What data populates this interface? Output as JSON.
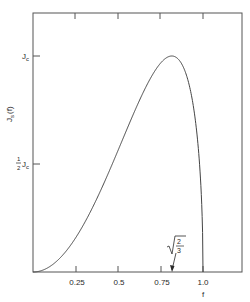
{
  "chart_data": {
    "type": "line",
    "title": "",
    "xlabel": "f",
    "ylabel": "J_s(f)",
    "xlim": [
      0,
      1.2
    ],
    "ylim": [
      0,
      1.05
    ],
    "grid": false,
    "x_ticks": [
      0.25,
      0.5,
      0.75,
      1.0
    ],
    "x_tick_labels": [
      "0.25",
      "0.5",
      "0.75",
      "1.0"
    ],
    "y_ticks": [
      0.5,
      1.0
    ],
    "y_tick_labels": [
      "½ J_c",
      "J_c"
    ],
    "series": [
      {
        "name": "J_s(f)",
        "formula": "J_c * f^2 * sqrt(1 - f^2) / ((2/3) * sqrt(1/3))",
        "x": [
          0,
          0.1,
          0.2,
          0.3,
          0.4,
          0.5,
          0.6,
          0.7,
          0.75,
          0.8,
          0.816,
          0.85,
          0.9,
          0.95,
          0.98,
          1.0
        ],
        "values": [
          0,
          0.026,
          0.102,
          0.223,
          0.381,
          0.563,
          0.748,
          0.909,
          0.963,
          0.998,
          1.0,
          0.993,
          0.915,
          0.732,
          0.496,
          0
        ]
      }
    ],
    "annotations": [
      {
        "text": "√(2/3)",
        "x": 0.816,
        "y": 0,
        "type": "arrow",
        "note": "peak location of J_s"
      }
    ]
  },
  "labels": {
    "y_axis": "J",
    "y_axis_sub": "s",
    "y_axis_arg": "(f)",
    "x_axis": "f",
    "jc": "J",
    "jc_sub": "c",
    "half_num": "1",
    "half_den": "2",
    "sqrt_num": "2",
    "sqrt_den": "3",
    "x_ticks": [
      "0.25",
      "0.5",
      "0.75",
      "1.0"
    ]
  }
}
